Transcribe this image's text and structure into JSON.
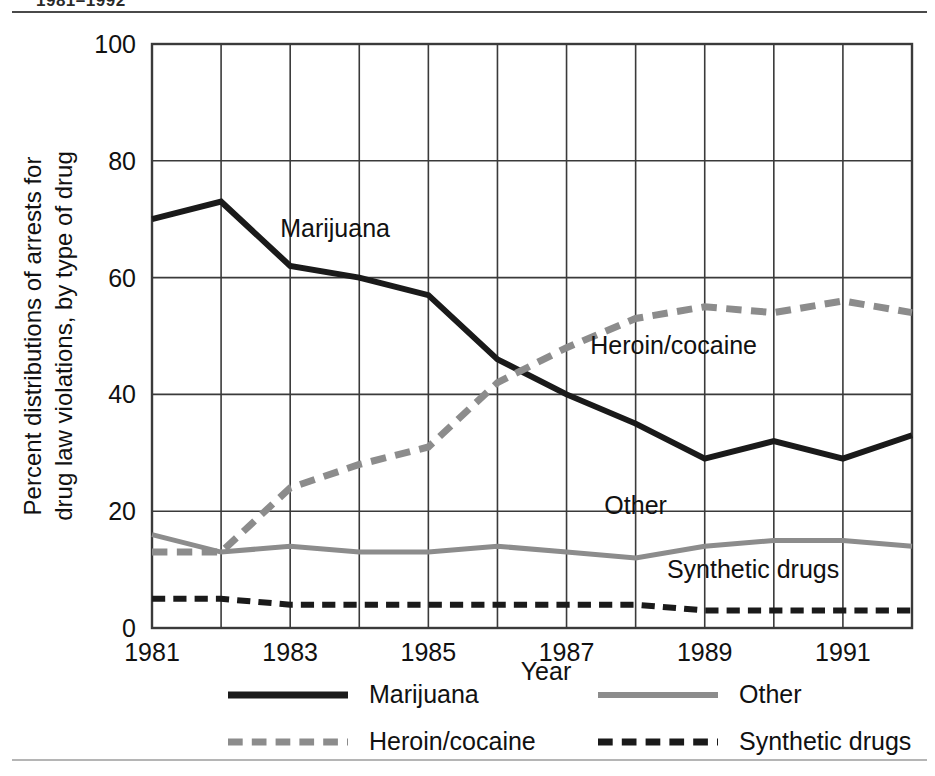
{
  "header": {
    "clipped_title": "1981–1992"
  },
  "chart_data": {
    "type": "line",
    "title": "",
    "xlabel": "Year",
    "ylabel_line1": "Percent distributions of arrests for",
    "ylabel_line2": "drug law violations, by type of drug",
    "x": [
      1981,
      1982,
      1983,
      1984,
      1985,
      1986,
      1987,
      1988,
      1989,
      1990,
      1991,
      1992
    ],
    "xlim": [
      1981,
      1992
    ],
    "ylim": [
      0,
      100
    ],
    "xticks": [
      1981,
      1983,
      1985,
      1987,
      1989,
      1991
    ],
    "xtick_labels": [
      "1981",
      "1983",
      "1985",
      "1987",
      "1989",
      "1991"
    ],
    "yticks": [
      0,
      20,
      40,
      60,
      80,
      100
    ],
    "ytick_labels": [
      "0",
      "20",
      "40",
      "60",
      "80",
      "100"
    ],
    "grid": true,
    "grid_vertical_every": 1,
    "legend_position": "bottom",
    "series": [
      {
        "name": "Marijuana",
        "style": "solid",
        "color": "#1a1a1a",
        "width": 6,
        "values": [
          70,
          73,
          62,
          60,
          57,
          46,
          40,
          35,
          29,
          32,
          29,
          33
        ],
        "annotation": "Marijuana",
        "annotation_x": 1983.65,
        "annotation_y": 67
      },
      {
        "name": "Heroin/cocaine",
        "style": "dashed",
        "color": "#8c8c8c",
        "width": 7,
        "values": [
          13,
          13,
          24,
          28,
          31,
          42,
          48,
          53,
          55,
          54,
          56,
          54
        ],
        "annotation": "Heroin/cocaine",
        "annotation_x": 1988.55,
        "annotation_y": 47
      },
      {
        "name": "Other",
        "style": "solid",
        "color": "#8c8c8c",
        "width": 5,
        "values": [
          16,
          13,
          14,
          13,
          13,
          14,
          13,
          12,
          14,
          15,
          15,
          14
        ],
        "annotation": "Other",
        "annotation_x": 1988.0,
        "annotation_y": 19.5
      },
      {
        "name": "Synthetic drugs",
        "style": "dashed",
        "color": "#1a1a1a",
        "width": 6,
        "values": [
          5,
          5,
          4,
          4,
          4,
          4,
          4,
          4,
          3,
          3,
          3,
          3
        ],
        "annotation": "Synthetic drugs",
        "annotation_x": 1989.7,
        "annotation_y": 8.5
      }
    ]
  },
  "legend": {
    "items": [
      {
        "label": "Marijuana",
        "style": "solid",
        "color": "#1a1a1a",
        "width": 7
      },
      {
        "label": "Other",
        "style": "solid",
        "color": "#8c8c8c",
        "width": 6
      },
      {
        "label": "Heroin/cocaine",
        "style": "dashed",
        "color": "#8c8c8c",
        "width": 7
      },
      {
        "label": "Synthetic drugs",
        "style": "dashed",
        "color": "#1a1a1a",
        "width": 7
      }
    ]
  },
  "colors": {
    "dark": "#1a1a1a",
    "gray": "#8c8c8c",
    "grid": "#3a3a3a",
    "rule_top": "#4a4a4a",
    "rule_bottom": "#b5b5b5"
  }
}
